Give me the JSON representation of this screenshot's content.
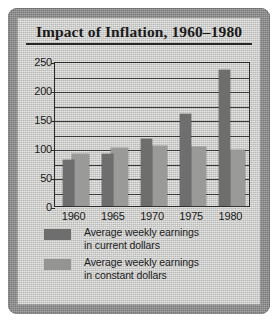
{
  "chart_data": {
    "type": "bar",
    "title": "Impact of Inflation, 1960–1980",
    "xlabel": "",
    "ylabel": "",
    "ylim": [
      0,
      250
    ],
    "yticks": [
      0,
      50,
      100,
      150,
      200,
      250
    ],
    "ytick_labels": [
      "0",
      "50",
      "100",
      "150",
      "200",
      "250"
    ],
    "minor_gridline_step": 25,
    "grid": true,
    "legend_position": "below-plot",
    "categories": [
      "1960",
      "1965",
      "1970",
      "1975",
      "1980"
    ],
    "series": [
      {
        "name": "Average weekly earnings in current dollars",
        "color": "#6e6e6e",
        "values": [
          80,
          90,
          115,
          159,
          235
        ]
      },
      {
        "name": "Average weekly earnings in constant dollars",
        "color": "#9a9a98",
        "values": [
          89,
          100,
          103,
          101,
          96
        ]
      }
    ]
  },
  "figure": {
    "title": "Impact of Inflation, 1960–1980",
    "frame_color": "#8d8d8d",
    "panel_color": "#c9c9c7"
  },
  "axes": {
    "y_tick_labels": [
      "250",
      "200",
      "150",
      "100",
      "50",
      "0"
    ],
    "x_tick_labels": [
      "1960",
      "1965",
      "1970",
      "1975",
      "1980"
    ]
  },
  "legend": {
    "items": [
      {
        "line1": "Average weekly earnings",
        "line2": "in current dollars",
        "color": "#6e6e6e"
      },
      {
        "line1": "Average weekly earnings",
        "line2": "in constant dollars",
        "color": "#949492"
      }
    ]
  }
}
